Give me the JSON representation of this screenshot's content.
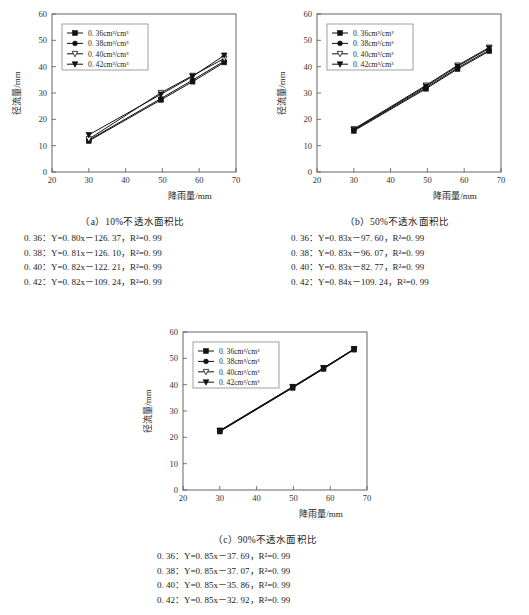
{
  "figure": {
    "axis": {
      "xlabel": "降雨量/mm",
      "ylabel": "径流量/mm",
      "xticks": [
        "20",
        "30",
        "40",
        "50",
        "60",
        "70"
      ],
      "yticks": [
        "0",
        "10",
        "20",
        "30",
        "40",
        "50",
        "60"
      ],
      "xlim": [
        20,
        70
      ],
      "ylim": [
        0,
        60
      ]
    },
    "legend": [
      {
        "label": "0. 36cm³/cm³",
        "value": "0.36",
        "marker": "filled-square"
      },
      {
        "label": "0. 38cm³/cm³",
        "value": "0.38",
        "marker": "filled-circle"
      },
      {
        "label": "0. 40cm³/cm³",
        "value": "0.40",
        "marker": "open-triangle-down"
      },
      {
        "label": "0. 42cm³/cm³",
        "value": "0.42",
        "marker": "filled-triangle-down"
      }
    ],
    "panels": [
      {
        "id": "a",
        "caption": "（a）10%不透水面积比",
        "equations": [
          "0. 36：Y=0. 80x－126. 37，R²=0. 99",
          "0. 38：Y=0. 81x－126. 10，R²=0. 99",
          "0. 40：Y=0. 82x－122. 21，R²=0. 99",
          "0. 42：Y=0. 82x－109. 24，R²=0. 99"
        ]
      },
      {
        "id": "b",
        "caption": "（b）50%不透水面积比",
        "equations": [
          "0. 36：Y=0. 83x－97. 60，R²=0. 99",
          "0. 38：Y=0. 83x－96. 07，R²=0. 99",
          "0. 40：Y=0. 83x－82. 77，R²=0. 99",
          "0. 42：Y=0. 84x－109. 24，R²=0. 99"
        ]
      },
      {
        "id": "c",
        "caption": "（c）90%不透水面积比",
        "equations": [
          "0. 36：Y=0. 85x－37. 69，R²=0. 99",
          "0. 38：Y=0. 85x－37. 07，R²=0. 99",
          "0. 40：Y=0. 85x－35. 86，R²=0. 99",
          "0. 42：Y=0. 85x－32. 92，R²=0. 99"
        ]
      }
    ]
  },
  "chart_data": [
    {
      "type": "line",
      "panel": "a",
      "title": "（a）10%不透水面积比",
      "xlabel": "降雨量/mm",
      "ylabel": "径流量/mm",
      "xlim": [
        20,
        70
      ],
      "ylim": [
        0,
        60
      ],
      "grid": false,
      "legend_position": "upper-left",
      "x": [
        30,
        49.6,
        58.2,
        66.8
      ],
      "series": [
        {
          "name": "0.36cm³/cm³",
          "marker": "filled-square",
          "values": [
            11.8,
            27.4,
            34.3,
            41.6
          ]
        },
        {
          "name": "0.38cm³/cm³",
          "marker": "filled-circle",
          "values": [
            12.1,
            27.9,
            34.9,
            42.1
          ]
        },
        {
          "name": "0.40cm³/cm³",
          "marker": "open-triangle-down",
          "values": [
            12.5,
            30.1,
            36.6,
            43.1
          ]
        },
        {
          "name": "0.42cm³/cm³",
          "marker": "filled-triangle-down",
          "values": [
            14.1,
            29.5,
            36.3,
            44.3
          ]
        }
      ]
    },
    {
      "type": "line",
      "panel": "b",
      "title": "（b）50%不透水面积比",
      "xlabel": "降雨量/mm",
      "ylabel": "径流量/mm",
      "xlim": [
        20,
        70
      ],
      "ylim": [
        0,
        60
      ],
      "grid": false,
      "legend_position": "upper-left",
      "x": [
        30,
        49.6,
        58.2,
        66.8
      ],
      "series": [
        {
          "name": "0.36cm³/cm³",
          "marker": "filled-square",
          "values": [
            15.6,
            31.6,
            39.1,
            45.9
          ]
        },
        {
          "name": "0.38cm³/cm³",
          "marker": "filled-circle",
          "values": [
            15.9,
            32.0,
            39.5,
            46.3
          ]
        },
        {
          "name": "0.40cm³/cm³",
          "marker": "open-triangle-down",
          "values": [
            16.3,
            32.9,
            40.5,
            47.3
          ]
        },
        {
          "name": "0.42cm³/cm³",
          "marker": "filled-triangle-down",
          "values": [
            16.1,
            32.5,
            40.1,
            47.0
          ]
        }
      ]
    },
    {
      "type": "line",
      "panel": "c",
      "title": "（c）90%不透水面积比",
      "xlabel": "降雨量/mm",
      "ylabel": "径流量/mm",
      "xlim": [
        20,
        70
      ],
      "ylim": [
        0,
        60
      ],
      "grid": false,
      "legend_position": "upper-left",
      "x": [
        30,
        49.8,
        58.2,
        66.5
      ],
      "series": [
        {
          "name": "0.36cm³/cm³",
          "marker": "filled-square",
          "values": [
            22.2,
            38.8,
            46.0,
            53.3
          ]
        },
        {
          "name": "0.38cm³/cm³",
          "marker": "filled-circle",
          "values": [
            22.3,
            38.9,
            46.1,
            53.4
          ]
        },
        {
          "name": "0.40cm³/cm³",
          "marker": "open-triangle-down",
          "values": [
            22.5,
            39.1,
            46.3,
            53.5
          ]
        },
        {
          "name": "0.42cm³/cm³",
          "marker": "filled-triangle-down",
          "values": [
            22.6,
            39.2,
            46.4,
            53.6
          ]
        }
      ]
    }
  ]
}
